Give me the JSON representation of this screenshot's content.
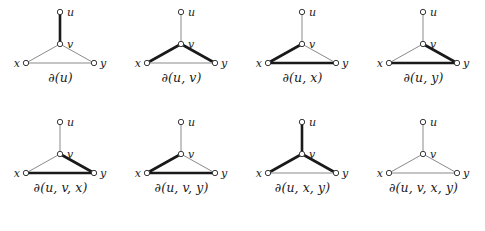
{
  "document": {
    "type": "mathematical-diagram",
    "subject": "graph edge boundary cuts",
    "background_color": "#ffffff",
    "vertex_stroke_color": "#3a3a3a",
    "thin_edge_color": "#8a8a8a",
    "thick_edge_color": "#1a1a1a",
    "thin_edge_width": 1,
    "thick_edge_width": 2.6
  },
  "vertex_labels": {
    "u": "u",
    "v": "v",
    "x": "x",
    "y": "y"
  },
  "edges": [
    "u-v",
    "v-x",
    "v-y",
    "x-y"
  ],
  "figures": [
    {
      "index": 1,
      "caption": "∂(u)",
      "set": [
        "u"
      ],
      "thick_edges": [
        "u-v"
      ],
      "edge_states": {
        "u-v": "thick",
        "v-x": "thin",
        "v-y": "thin",
        "x-y": "thin"
      }
    },
    {
      "index": 2,
      "caption": "∂(u, v)",
      "set": [
        "u",
        "v"
      ],
      "thick_edges": [
        "v-x",
        "v-y"
      ],
      "edge_states": {
        "u-v": "thin",
        "v-x": "thick",
        "v-y": "thick",
        "x-y": "thin"
      }
    },
    {
      "index": 3,
      "caption": "∂(u, x)",
      "set": [
        "u",
        "x"
      ],
      "thick_edges": [
        "v-x",
        "x-y"
      ],
      "edge_states": {
        "u-v": "thin",
        "v-x": "thick",
        "v-y": "thin",
        "x-y": "thick"
      }
    },
    {
      "index": 4,
      "caption": "∂(u, y)",
      "set": [
        "u",
        "y"
      ],
      "thick_edges": [
        "v-y",
        "x-y"
      ],
      "edge_states": {
        "u-v": "thin",
        "v-x": "thin",
        "v-y": "thick",
        "x-y": "thick"
      }
    },
    {
      "index": 5,
      "caption": "∂(u, v, x)",
      "set": [
        "u",
        "v",
        "x"
      ],
      "thick_edges": [
        "v-y",
        "x-y"
      ],
      "edge_states": {
        "u-v": "thin",
        "v-x": "thin",
        "v-y": "thick",
        "x-y": "thick"
      }
    },
    {
      "index": 6,
      "caption": "∂(u, v, y)",
      "set": [
        "u",
        "v",
        "y"
      ],
      "thick_edges": [
        "v-x",
        "x-y"
      ],
      "edge_states": {
        "u-v": "thin",
        "v-x": "thick",
        "v-y": "thin",
        "x-y": "thick"
      }
    },
    {
      "index": 7,
      "caption": "∂(u, x, y)",
      "set": [
        "u",
        "x",
        "y"
      ],
      "thick_edges": [
        "u-v",
        "v-x",
        "v-y"
      ],
      "edge_states": {
        "u-v": "thick",
        "v-x": "thick",
        "v-y": "thick",
        "x-y": "thin"
      }
    },
    {
      "index": 8,
      "caption": "∂(u, v, x, y)",
      "set": [
        "u",
        "v",
        "x",
        "y"
      ],
      "thick_edges": [],
      "edge_states": {
        "u-v": "thin",
        "v-x": "thin",
        "v-y": "thin",
        "x-y": "thin"
      }
    }
  ],
  "geometry": {
    "u": {
      "x": 60,
      "y": 8
    },
    "v": {
      "x": 60,
      "y": 40
    },
    "x": {
      "x": 26,
      "y": 59
    },
    "y": {
      "x": 94,
      "y": 59
    },
    "node_radius": 2.7
  }
}
